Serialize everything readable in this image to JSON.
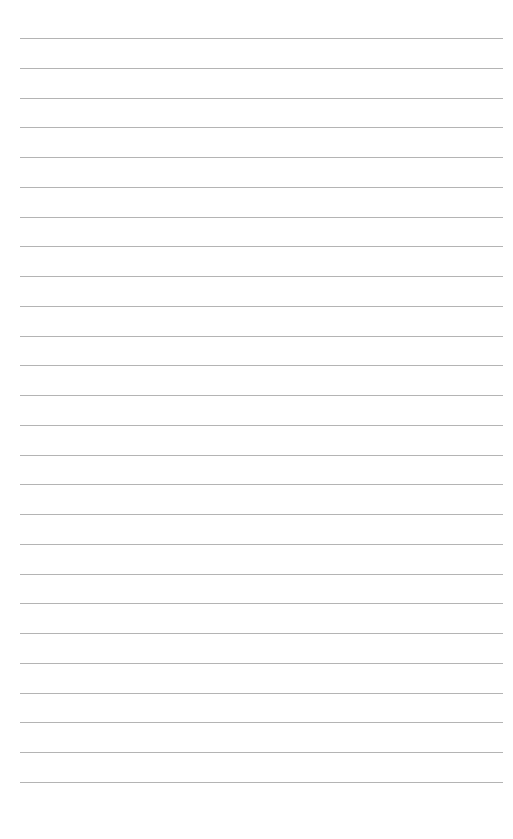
{
  "page": {
    "type": "lined-paper",
    "background": "#ffffff",
    "line_color": "#b4b4b4",
    "line_count": 26,
    "first_line_y": 38,
    "line_spacing": 29.76,
    "line_left": 20,
    "line_width": 483
  }
}
